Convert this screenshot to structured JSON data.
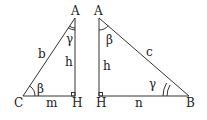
{
  "left_triangle": {
    "vertices": {
      "A": "A",
      "C": "C",
      "H": "H"
    },
    "sides": {
      "hyp": "b",
      "height": "h",
      "base": "m"
    },
    "angles": {
      "at_A": "γ",
      "at_C": "β"
    }
  },
  "right_triangle": {
    "vertices": {
      "A": "A",
      "H": "H",
      "B": "B"
    },
    "sides": {
      "hyp": "c",
      "height": "h",
      "base": "n"
    },
    "angles": {
      "at_A": "β",
      "at_B": "γ"
    }
  },
  "colors": {
    "stroke": "#333333",
    "text": "#222222",
    "background": "#ffffff"
  }
}
